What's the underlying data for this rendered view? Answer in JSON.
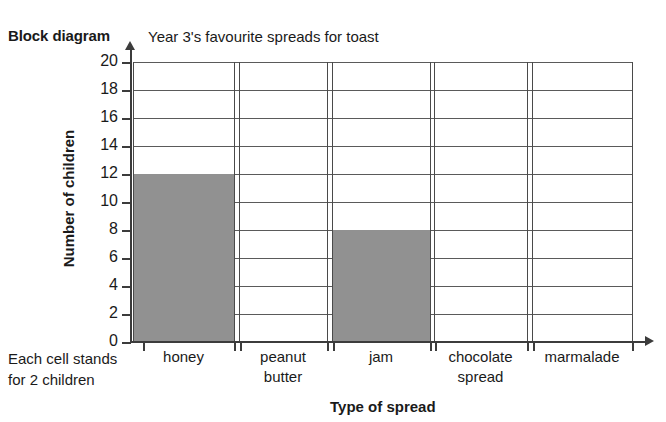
{
  "labels": {
    "block_diagram": "Block diagram",
    "title": "Year 3's favourite spreads for toast",
    "y_axis_title": "Number of children",
    "x_axis_title": "Type of spread",
    "key_line_1": "Each cell stands",
    "key_line_2": "for 2 children"
  },
  "chart_data": {
    "type": "bar",
    "title": "Year 3's favourite spreads for toast",
    "xlabel": "Type of spread",
    "ylabel": "Number of children",
    "ylim": [
      0,
      20
    ],
    "ytick_step": 2,
    "ytick_labels": [
      "20",
      "18",
      "16",
      "14",
      "12",
      "10",
      "8",
      "6",
      "4",
      "2",
      "0"
    ],
    "grid": true,
    "legend": null,
    "annotation": "Each cell stands for 2 children",
    "bar_color": "#919191",
    "categories": [
      "honey",
      "peanut butter",
      "jam",
      "chocolate spread",
      "marmalade"
    ],
    "category_label_lines": [
      [
        "honey"
      ],
      [
        "peanut",
        "butter"
      ],
      [
        "jam"
      ],
      [
        "chocolate",
        "spread"
      ],
      [
        "marmalade"
      ]
    ],
    "values": [
      12,
      0,
      8,
      0,
      0
    ]
  }
}
